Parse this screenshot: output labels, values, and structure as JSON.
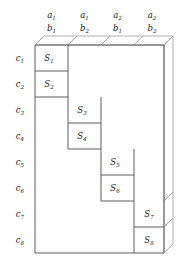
{
  "diagram": {
    "column_headers": [
      {
        "top": "a",
        "top_sub": "1",
        "bottom": "b",
        "bottom_sub": "1"
      },
      {
        "top": "a",
        "top_sub": "1",
        "bottom": "b",
        "bottom_sub": "2"
      },
      {
        "top": "a",
        "top_sub": "2",
        "bottom": "b",
        "bottom_sub": "1"
      },
      {
        "top": "a",
        "top_sub": "2",
        "bottom": "b",
        "bottom_sub": "2"
      }
    ],
    "row_headers": [
      {
        "base": "c",
        "sub": "1"
      },
      {
        "base": "c",
        "sub": "2"
      },
      {
        "base": "c",
        "sub": "3"
      },
      {
        "base": "c",
        "sub": "4"
      },
      {
        "base": "c",
        "sub": "5"
      },
      {
        "base": "c",
        "sub": "6"
      },
      {
        "base": "c",
        "sub": "7"
      },
      {
        "base": "c",
        "sub": "8"
      }
    ],
    "cells": [
      {
        "base": "S",
        "sub": "1",
        "row": 1,
        "col": 1
      },
      {
        "base": "S",
        "sub": "2",
        "row": 2,
        "col": 1
      },
      {
        "base": "S",
        "sub": "3",
        "row": 3,
        "col": 2
      },
      {
        "base": "S",
        "sub": "4",
        "row": 4,
        "col": 2
      },
      {
        "base": "S",
        "sub": "5",
        "row": 5,
        "col": 3
      },
      {
        "base": "S",
        "sub": "6",
        "row": 6,
        "col": 3
      },
      {
        "base": "S",
        "sub": "7",
        "row": 7,
        "col": 4
      },
      {
        "base": "S",
        "sub": "8",
        "row": 8,
        "col": 4
      }
    ],
    "colors": {
      "stroke": "#4d4d4d",
      "stroke_light": "#8c8c8c",
      "background": "#ffffff",
      "text": "#1a1a1a"
    },
    "geometry": {
      "col_x": [
        35,
        68,
        101,
        134
      ],
      "col_width": 33,
      "row_y": [
        45,
        71,
        97,
        123,
        149,
        175,
        201,
        227
      ],
      "row_height": 26,
      "depth_dx": 9,
      "depth_dy": -9
    }
  }
}
